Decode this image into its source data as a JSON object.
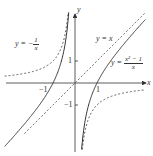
{
  "axes": {
    "x_label": "x",
    "y_label": "y",
    "ticks": {
      "x_pos": "1",
      "x_neg": "−1",
      "y_pos": "1",
      "y_neg": "−1"
    }
  },
  "labels": {
    "neg_recip": {
      "prefix": "y = −",
      "num": "1",
      "den": "x"
    },
    "identity": "y = x",
    "main": {
      "prefix": "y = ",
      "num": "x² − 1",
      "den": "x"
    }
  },
  "colors": {
    "curve": "#333333",
    "axis": "#333333",
    "background": "#ffffff"
  },
  "chart_data": {
    "type": "line",
    "title": "",
    "xlabel": "x",
    "ylabel": "y",
    "xlim": [
      -3.2,
      3.2
    ],
    "ylim": [
      -3.1,
      3.2
    ],
    "grid": false,
    "series": [
      {
        "name": "y = (x^2 - 1)/x",
        "style": "solid",
        "formula": "(x*x-1)/x"
      },
      {
        "name": "y = x",
        "style": "dashed",
        "formula": "x"
      },
      {
        "name": "y = -1/x",
        "style": "dashed",
        "formula": "-1/x"
      }
    ],
    "annotations": [
      "x-intercepts at x = -1 and x = 1",
      "vertical asymptote x = 0",
      "oblique asymptote y = x"
    ]
  }
}
